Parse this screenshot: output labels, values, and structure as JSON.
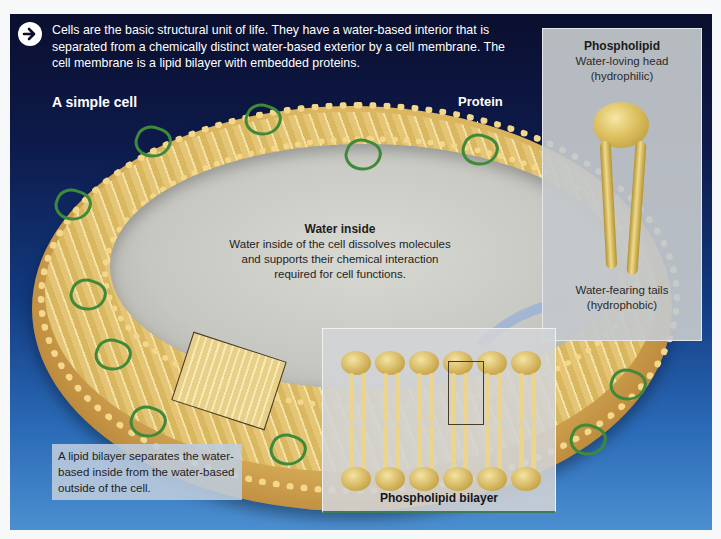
{
  "intro": {
    "icon": "arrow-right-circle-icon",
    "text": "Cells are the basic structural unit of life. They have a water-based interior that is separated from a chemically distinct water-based exterior by a cell membrane. The cell membrane is a lipid bilayer with embedded proteins."
  },
  "labels": {
    "simple_cell": "A simple cell",
    "protein": "Protein"
  },
  "water_inside": {
    "title": "Water inside",
    "body": "Water inside of the cell dissolves molecules and supports their chemical interaction required for cell functions."
  },
  "phospholipid": {
    "title": "Phospholipid",
    "head_label": "Water-loving head",
    "head_sub": "(hydrophilic)",
    "tail_label": "Water-fearing tails",
    "tail_sub": "(hydrophobic)"
  },
  "bilayer": {
    "label": "Phospholipid bilayer"
  },
  "note": {
    "text": "A lipid bilayer separates the water-based inside from the water-based outside of the cell."
  },
  "colors": {
    "panel_top": "#0a0f2e",
    "panel_bottom": "#4c8fd0",
    "membrane_gold": "#d9b25c",
    "protein_green": "#3f8a3a"
  }
}
